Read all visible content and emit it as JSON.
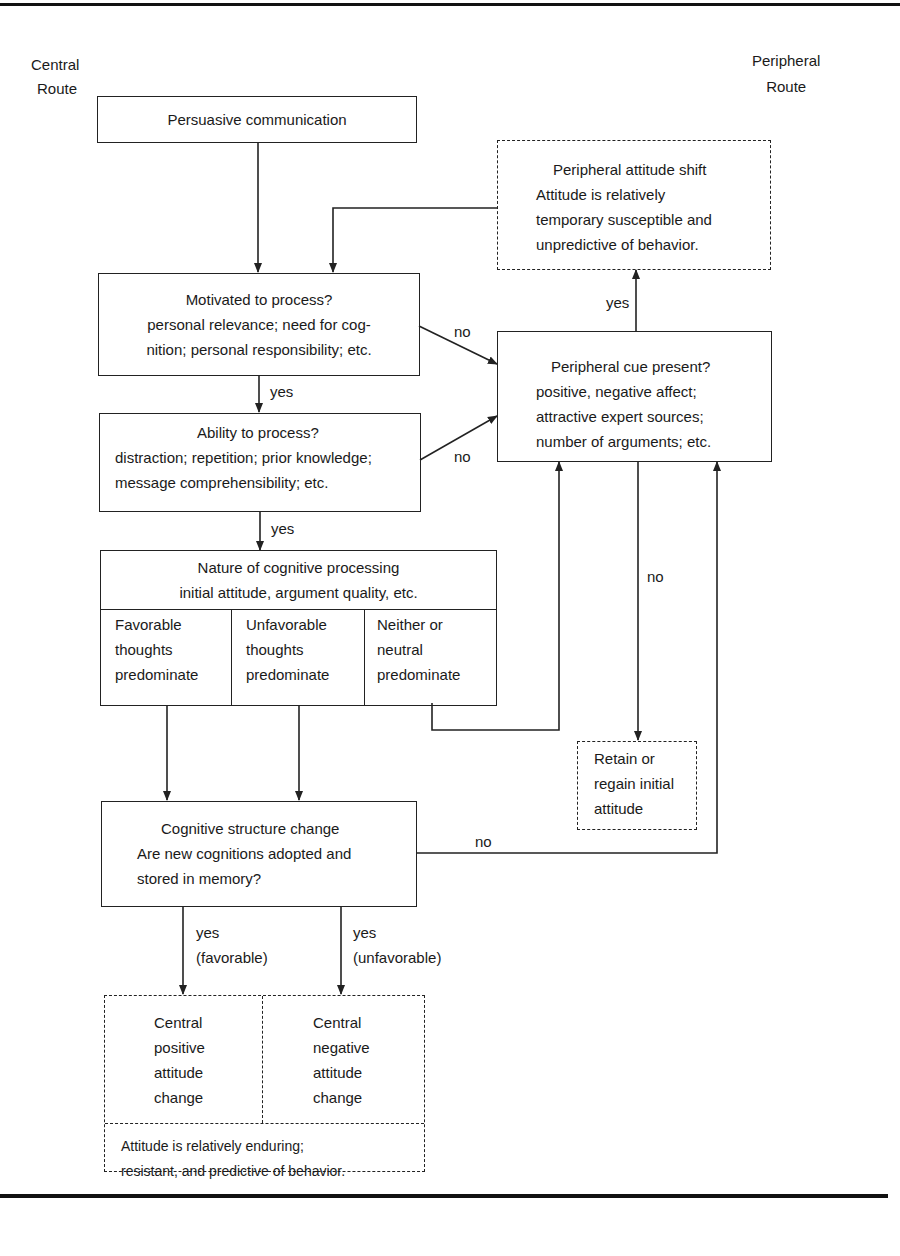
{
  "route_labels": {
    "central": [
      "Central",
      "Route"
    ],
    "peripheral": [
      "Peripheral",
      "Route"
    ]
  },
  "nodes": {
    "persuasive": "Persuasive communication",
    "motivated": [
      "Motivated to process?",
      "personal relevance; need for cog-",
      "nition; personal responsibility; etc."
    ],
    "ability": [
      "Ability to process?",
      "distraction; repetition; prior knowledge;",
      "message comprehensibility; etc."
    ],
    "nature": {
      "title": [
        "Nature of cognitive processing",
        "initial attitude, argument quality, etc."
      ],
      "cells": [
        [
          "Favorable",
          "thoughts",
          "predominate"
        ],
        [
          "Unfavorable",
          "thoughts",
          "predominate"
        ],
        [
          "Neither or",
          "neutral",
          "predominate"
        ]
      ]
    },
    "cognitive_change": [
      "Cognitive structure change",
      "Are new cognitions adopted and",
      "stored in memory?"
    ],
    "peripheral_shift": [
      "Peripheral attitude shift",
      "Attitude is relatively",
      "temporary susceptible and",
      "unpredictive of behavior."
    ],
    "peripheral_cue": [
      "Peripheral cue present?",
      "positive, negative affect;",
      "attractive expert sources;",
      "number of arguments; etc."
    ],
    "retain": [
      "Retain or",
      "regain initial",
      "attitude"
    ],
    "central_positive": [
      "Central",
      "positive",
      "attitude",
      "change"
    ],
    "central_negative": [
      "Central",
      "negative",
      "attitude",
      "change"
    ],
    "enduring": [
      "Attitude is relatively enduring;",
      "resistant, and predictive of behavior."
    ]
  },
  "edge_labels": {
    "motivated_no": "no",
    "motivated_yes": "yes",
    "ability_no": "no",
    "ability_yes": "yes",
    "cue_yes": "yes",
    "cue_no": "no",
    "change_no": "no",
    "change_yes_fav": [
      "yes",
      "(favorable)"
    ],
    "change_yes_unfav": [
      "yes",
      "(unfavorable)"
    ]
  }
}
